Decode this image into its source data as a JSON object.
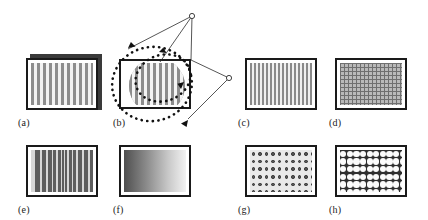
{
  "figure": {
    "kind": "texture-pattern-panel-figure",
    "background_color": "#ffffff",
    "width": 428,
    "height": 220,
    "panel_border_color": "#1a1a1a",
    "label_color": "#1a1a1a"
  },
  "panels": [
    {
      "id": "a",
      "label": "(a)",
      "texture": "coarse-vertical-bars",
      "description": "Vertical grating, wide bars, light background, drawn as a slab with drop shadow",
      "stripe_count": 15,
      "bar_color": "#8d8d8d",
      "gap_color": "#f2f2f2",
      "has_shadow": true
    },
    {
      "id": "b",
      "label": "(b)",
      "texture": "coarse-vertical-bars-with-lens",
      "description": "Same grating seen through a circular lens, annotated with dotted rotation ellipses and two viewpoint vertices",
      "stripe_count": 15,
      "bar_color": "#8d8d8d",
      "gap_color": "#f4f4f4",
      "annotations": {
        "rotation_ellipses": 2,
        "ellipse_style": "dotted",
        "arrowheads": 4,
        "viewpoint_vertices": 2,
        "vertex_marker": "small-open-circle",
        "ray_count": 5
      }
    },
    {
      "id": "c",
      "label": "(c)",
      "texture": "fine-vertical-bars",
      "description": "Vertical grating at higher spatial frequency",
      "stripe_count": 26,
      "bar_color": "#8a8a8a",
      "gap_color": "#f0f0f0"
    },
    {
      "id": "d",
      "label": "(d)",
      "texture": "fine-grid",
      "description": "Dense cross-hatched grid of horizontal and vertical lines",
      "columns": 24,
      "rows": 17,
      "line_color": "#6f6f6f",
      "cell_color": "#b9b9b9"
    },
    {
      "id": "e",
      "label": "(e)",
      "texture": "chirp-vertical-bars",
      "description": "Vertical bars on dark ground whose spacing narrows toward the centre",
      "stripe_count": 21,
      "bar_color": "#d8d8d8",
      "ground_color": "#5e5e5e"
    },
    {
      "id": "f",
      "label": "(f)",
      "texture": "horizontal-gradient",
      "description": "Smooth luminance ramp, dark at the left edge to light at the right edge",
      "gradient_from": "#4f4f4f",
      "gradient_to": "#f2f2f2"
    },
    {
      "id": "g",
      "label": "(g)",
      "texture": "dark-dot-lattice",
      "description": "Regular lattice of small dark discs on a light ground",
      "columns": 10,
      "rows": 6,
      "dot_color": "#595959",
      "ground_color": "#e9e9e9"
    },
    {
      "id": "h",
      "label": "(h)",
      "texture": "light-circle-lattice",
      "description": "Regular lattice of larger light discs on a dark ground",
      "columns": 10,
      "rows": 6,
      "dot_color": "#fbfbfb",
      "ground_color": "#2e2e2e"
    }
  ]
}
